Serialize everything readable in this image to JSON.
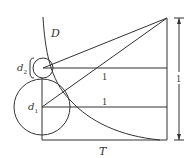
{
  "diagram": {
    "labels": {
      "curve": "D",
      "base": "T",
      "small_circle": "d",
      "small_circle_sub": "2",
      "large_circle": "d",
      "large_circle_sub": "1",
      "upper_segment": "1",
      "lower_segment": "1",
      "height_dimension": "1"
    },
    "colors": {
      "stroke": "#333333",
      "background": "#ffffff"
    }
  }
}
